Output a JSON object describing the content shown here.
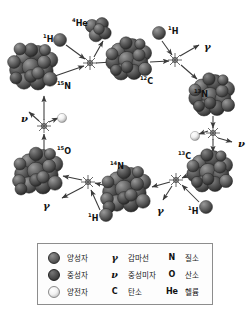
{
  "diagram": {
    "nuclei": [
      {
        "id": "n15-left",
        "label_sup": "15",
        "label_main": "N",
        "x": 57,
        "y": 83,
        "cx": 35,
        "cy": 68,
        "r": 22,
        "spheres": 17
      },
      {
        "id": "he4",
        "label_sup": "4",
        "label_main": "He",
        "x": 72,
        "y": 20,
        "cx": 97,
        "cy": 30,
        "r": 11,
        "spheres": 5
      },
      {
        "id": "c12",
        "label_sup": "12",
        "label_main": "C",
        "x": 140,
        "y": 78,
        "cx": 130,
        "cy": 60,
        "r": 21,
        "spheres": 15
      },
      {
        "id": "n13",
        "label_sup": "13",
        "label_main": "N",
        "x": 194,
        "y": 91,
        "cx": 213,
        "cy": 96,
        "r": 21,
        "spheres": 15
      },
      {
        "id": "c13",
        "label_sup": "13",
        "label_main": "C",
        "x": 178,
        "y": 153,
        "cx": 211,
        "cy": 172,
        "r": 21,
        "spheres": 15
      },
      {
        "id": "n14",
        "label_sup": "14",
        "label_main": "N",
        "x": 110,
        "y": 163,
        "cx": 128,
        "cy": 190,
        "r": 22,
        "spheres": 17
      },
      {
        "id": "o15",
        "label_sup": "15",
        "label_main": "O",
        "x": 57,
        "y": 148,
        "cx": 40,
        "cy": 172,
        "r": 22,
        "spheres": 17
      }
    ],
    "protons": [
      {
        "id": "h1-topleft",
        "label_sup": "1",
        "label_main": "H",
        "lx": 43,
        "ly": 36,
        "cx": 60,
        "cy": 40,
        "r": 6.5
      },
      {
        "id": "h1-topright",
        "label_sup": "1",
        "label_main": "H",
        "lx": 168,
        "ly": 28,
        "cx": 159,
        "cy": 33,
        "r": 6.5
      },
      {
        "id": "h1-bottomright",
        "label_sup": "1",
        "label_main": "H",
        "lx": 188,
        "ly": 208,
        "cx": 206,
        "cy": 207,
        "r": 6.5
      },
      {
        "id": "h1-bottomleft",
        "label_sup": "1",
        "label_main": "H",
        "lx": 88,
        "ly": 215,
        "cx": 106,
        "cy": 215,
        "r": 6.5
      }
    ],
    "reaction_nodes": [
      {
        "id": "node-top-left",
        "cx": 90,
        "cy": 63
      },
      {
        "id": "node-top-right",
        "cx": 175,
        "cy": 60
      },
      {
        "id": "node-right-decay",
        "cx": 213,
        "cy": 133
      },
      {
        "id": "node-bottom-right",
        "cx": 176,
        "cy": 180
      },
      {
        "id": "node-bottom-left",
        "cx": 88,
        "cy": 182
      },
      {
        "id": "node-left-decay",
        "cx": 44,
        "cy": 126
      }
    ],
    "emitted": [
      {
        "id": "gamma-top-right",
        "symbol": "γ",
        "x": 204,
        "y": 42
      },
      {
        "id": "gamma-bottom-right",
        "symbol": "γ",
        "x": 157,
        "y": 206
      },
      {
        "id": "gamma-bottom-left",
        "symbol": "γ",
        "x": 43,
        "y": 201
      },
      {
        "id": "nu-right",
        "symbol": "ν",
        "x": 238,
        "y": 139
      },
      {
        "id": "nu-left",
        "symbol": "ν",
        "x": 21,
        "y": 114
      }
    ],
    "positrons": [
      {
        "id": "positron-right",
        "cx": 195,
        "cy": 136
      },
      {
        "id": "positron-left",
        "cx": 62,
        "cy": 118
      }
    ]
  },
  "legend": {
    "rows": [
      {
        "c1": {
          "icon": "proton-sphere-icon",
          "kind": "ball",
          "ball": "proton",
          "text": "양성자"
        },
        "c2": {
          "icon": "gamma-symbol-icon",
          "kind": "symbol",
          "symbol": "γ",
          "style": "italic",
          "text": "감마선"
        },
        "c3": {
          "icon": "nitrogen-symbol-icon",
          "kind": "symbol",
          "symbol": "N",
          "style": "roman",
          "text": "질소"
        }
      },
      {
        "c1": {
          "icon": "neutron-sphere-icon",
          "kind": "ball",
          "ball": "neutron",
          "text": "중성자"
        },
        "c2": {
          "icon": "nu-symbol-icon",
          "kind": "symbol",
          "symbol": "ν",
          "style": "italic",
          "text": "중성미자"
        },
        "c3": {
          "icon": "oxygen-symbol-icon",
          "kind": "symbol",
          "symbol": "O",
          "style": "roman",
          "text": "산소"
        }
      },
      {
        "c1": {
          "icon": "positron-sphere-icon",
          "kind": "ball",
          "ball": "positron",
          "text": "양전자"
        },
        "c2": {
          "icon": "carbon-symbol-icon",
          "kind": "symbol",
          "symbol": "C",
          "style": "roman",
          "text": "탄소"
        },
        "c3": {
          "icon": "helium-symbol-icon",
          "kind": "symbol",
          "symbol": "He",
          "style": "roman",
          "text": "헬륨"
        }
      }
    ]
  },
  "colors": {
    "nucleus_dark": "#4a4a4a",
    "nucleus_mid": "#6a6a6a",
    "positron_light": "#f0f0f0",
    "arrow": "#3a3a3a",
    "legend_border": "#8d8d8d",
    "background": "#ffffff"
  }
}
